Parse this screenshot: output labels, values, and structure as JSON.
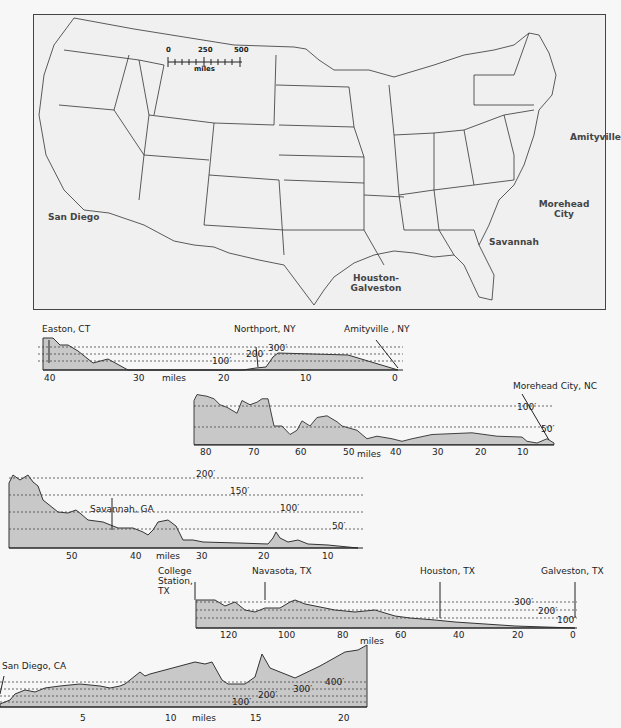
{
  "map": {
    "scale": {
      "ticks": [
        "0",
        "250",
        "500"
      ],
      "unit": "miles"
    },
    "labels": [
      {
        "id": "amityville",
        "text": "Amityville"
      },
      {
        "id": "morehead",
        "text": "Morehead City"
      },
      {
        "id": "savannah",
        "text": "Savannah"
      },
      {
        "id": "houston",
        "text": "Houston-Galveston"
      },
      {
        "id": "sandiego",
        "text": "San Diego"
      }
    ]
  },
  "profiles": [
    {
      "id": "easton-amityville",
      "start": "Easton, CT",
      "mid": "Northport, NY",
      "end": "Amityville , NY",
      "contours": [
        "100′",
        "200′",
        "300′"
      ],
      "axis_ticks": [
        "40",
        "30",
        "miles",
        "20",
        "10",
        "0"
      ]
    },
    {
      "id": "morehead",
      "end": "Morehead City, NC",
      "contours": [
        "50′",
        "100′"
      ],
      "axis_ticks": [
        "80",
        "70",
        "60",
        "50",
        "miles",
        "40",
        "30",
        "20",
        "10"
      ]
    },
    {
      "id": "savannah",
      "mid": "Savannah, GA",
      "contours": [
        "50′",
        "100′",
        "150′",
        "200′"
      ],
      "axis_ticks": [
        "50",
        "40",
        "miles",
        "30",
        "20",
        "10"
      ]
    },
    {
      "id": "houston",
      "start": "College Station, TX",
      "mid1": "Navasota, TX",
      "mid2": "Houston, TX",
      "end": "Galveston, TX",
      "contours": [
        "100′",
        "200′",
        "300′"
      ],
      "axis_ticks": [
        "120",
        "100",
        "80",
        "miles",
        "60",
        "40",
        "20",
        "0"
      ]
    },
    {
      "id": "sandiego",
      "start": "San Diego, CA",
      "contours": [
        "100′",
        "200′",
        "300′",
        "400′"
      ],
      "axis_ticks": [
        "5",
        "10",
        "miles",
        "15",
        "20"
      ]
    }
  ],
  "colors": {
    "fill": "#c8c8c8",
    "line": "#333333",
    "background": "#f7f7f7"
  }
}
